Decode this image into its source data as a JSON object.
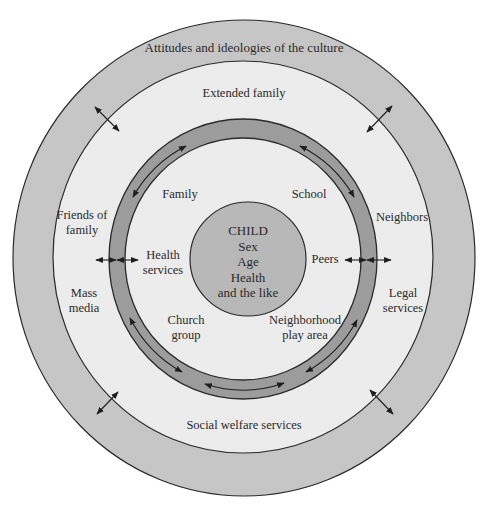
{
  "diagram": {
    "colors": {
      "background": "#ffffff",
      "culture_band": "#c6c6c6",
      "community_fill": "#ececec",
      "interaction_ring": "#9c9c9c",
      "child_circle": "#b8b8b8",
      "stroke": "#2a2a2a"
    },
    "layers": {
      "culture": {
        "label": "Attitudes and ideologies of the culture"
      },
      "community": {
        "labels": {
          "top": "Extended family",
          "left_upper": [
            "Friends of",
            "family"
          ],
          "left_lower": [
            "Mass",
            "media"
          ],
          "right_upper": "Neighbors",
          "right_lower": [
            "Legal",
            "services"
          ],
          "bottom": "Social welfare services"
        }
      },
      "microsystem": {
        "labels": {
          "family": "Family",
          "school": "School",
          "health": [
            "Health",
            "services"
          ],
          "peers": "Peers",
          "church": [
            "Church",
            "group"
          ],
          "neighborhood": [
            "Neighborhood",
            "play area"
          ]
        }
      },
      "child": {
        "lines": [
          "CHILD",
          "Sex",
          "Age",
          "Health",
          "and the like"
        ]
      }
    }
  }
}
